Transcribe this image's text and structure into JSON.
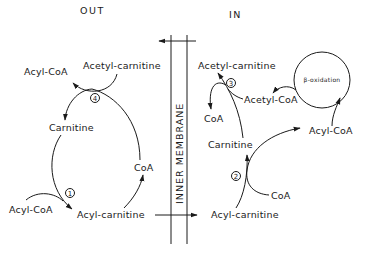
{
  "sides": {
    "outside": "OUT",
    "inside": "IN"
  },
  "membrane": {
    "label": "INNER MEMBRANE"
  },
  "outside": {
    "acyl_coa_top": "Acyl-CoA",
    "acetyl_carnitine": "Acetyl-carnitine",
    "carnitine": "Carnitine",
    "coa": "CoA",
    "acyl_coa_bottom": "Acyl-CoA",
    "acyl_carnitine": "Acyl-carnitine",
    "step_4": "4",
    "step_1": "1"
  },
  "inside": {
    "acetyl_carnitine": "Acetyl-carnitine",
    "acetyl_coa": "Acetyl-CoA",
    "coa_top": "CoA",
    "carnitine": "Carnitine",
    "acyl_coa": "Acyl-CoA",
    "coa_bottom": "CoA",
    "acyl_carnitine": "Acyl-carnitine",
    "beta_oxidation": "β-oxidation",
    "step_3": "3",
    "step_2": "2"
  }
}
